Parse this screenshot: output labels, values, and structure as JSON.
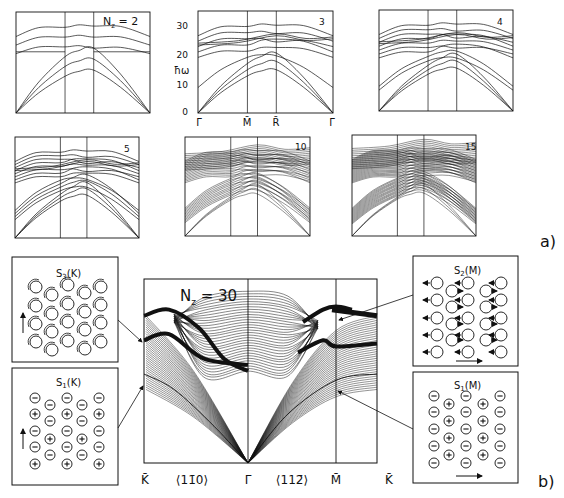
{
  "figure": {
    "part_a_label": "a)",
    "part_b_label": "b)"
  },
  "chart_data": [
    {
      "type": "line",
      "panel": "a",
      "title": "N_z = 2",
      "label": "N_z = 2",
      "x_ticks": [
        "Γ̄",
        "M̄",
        "R̄",
        "Γ̄"
      ],
      "ylabel": "ħω",
      "ylim": [
        0,
        33
      ],
      "series_count": 6,
      "series": [
        {
          "name": "branch1",
          "x": [
            0,
            1,
            2,
            3
          ],
          "values": [
            11,
            26,
            24,
            11
          ]
        },
        {
          "name": "branch2",
          "x": [
            0,
            1,
            2,
            3
          ],
          "values": [
            11,
            26,
            25,
            11
          ]
        },
        {
          "name": "branch3",
          "x": [
            0,
            1,
            2,
            3
          ],
          "values": [
            0,
            17,
            22,
            0
          ]
        },
        {
          "name": "branch4",
          "x": [
            0,
            1,
            2,
            3
          ],
          "values": [
            0,
            15,
            15,
            0
          ]
        },
        {
          "name": "branch5",
          "x": [
            0,
            1,
            2,
            3
          ],
          "values": [
            0,
            12,
            17,
            0
          ]
        },
        {
          "name": "flat",
          "x": [
            0,
            1,
            2,
            3
          ],
          "values": [
            20,
            20,
            20,
            20
          ]
        }
      ]
    },
    {
      "type": "line",
      "panel": "a",
      "label": "3",
      "x_ticks": [
        "Γ̄",
        "M̄",
        "R̄",
        "Γ̄"
      ],
      "ylabel": "ħω",
      "y_ticks": [
        0,
        10,
        20,
        30
      ],
      "ylim": [
        0,
        34
      ],
      "series": [
        {
          "name": "branch1",
          "x": [
            0,
            1,
            2,
            3
          ],
          "values": [
            14,
            28,
            26,
            14
          ]
        },
        {
          "name": "branch2",
          "x": [
            0,
            1,
            2,
            3
          ],
          "values": [
            15,
            27,
            26,
            15
          ]
        },
        {
          "name": "flat1",
          "x": [
            0,
            1,
            2,
            3
          ],
          "values": [
            25,
            25,
            26,
            25
          ]
        },
        {
          "name": "branch3",
          "x": [
            0,
            1,
            2,
            3
          ],
          "values": [
            8,
            21,
            23,
            8
          ]
        },
        {
          "name": "branch4",
          "x": [
            0,
            1,
            2,
            3
          ],
          "values": [
            0,
            17,
            23,
            0
          ]
        },
        {
          "name": "branch5",
          "x": [
            0,
            1,
            2,
            3
          ],
          "values": [
            0,
            16,
            19,
            0
          ]
        },
        {
          "name": "branch6",
          "x": [
            0,
            1,
            2,
            3
          ],
          "values": [
            0,
            13,
            15,
            0
          ]
        },
        {
          "name": "flat2",
          "x": [
            0,
            1,
            2,
            3
          ],
          "values": [
            19,
            19,
            19,
            19
          ]
        }
      ]
    },
    {
      "type": "line",
      "panel": "a",
      "label": "4",
      "x_ticks": [
        "Γ̄",
        "M̄",
        "R̄",
        "Γ̄"
      ],
      "series_count": 10
    },
    {
      "type": "line",
      "panel": "a",
      "label": "5",
      "x_ticks": [
        "Γ̄",
        "M̄",
        "R̄",
        "Γ̄"
      ],
      "series_count": 14
    },
    {
      "type": "line",
      "panel": "a",
      "label": "10",
      "x_ticks": [
        "Γ̄",
        "M̄",
        "R̄",
        "Γ̄"
      ],
      "series_count": 28
    },
    {
      "type": "line",
      "panel": "a",
      "label": "15",
      "x_ticks": [
        "Γ̄",
        "M̄",
        "R̄",
        "Γ̄"
      ],
      "series_count": 42
    },
    {
      "type": "line",
      "panel": "b",
      "label": "N_z = 30",
      "title": "N_z = 30",
      "x_ticks": [
        "K̄",
        "⟨11̄0⟩",
        "Γ̄",
        "⟨112̄⟩",
        "M̄",
        "K̄"
      ],
      "annotations": [
        "S3(K)",
        "S1(K)",
        "S2(M)",
        "S1(M)"
      ],
      "series": [
        {
          "name": "surface mode S1",
          "x": [
            "K̄",
            "Γ̄",
            "M̄",
            "K̄"
          ],
          "values": [
            13,
            0,
            13,
            14
          ]
        },
        {
          "name": "bulk band top",
          "x": [
            "K̄",
            "Γ̄",
            "M̄",
            "K̄"
          ],
          "values": [
            24,
            28,
            26,
            24
          ]
        }
      ]
    }
  ],
  "panels_a": [
    {
      "label_main": "N",
      "label_sub": "z",
      "label_rest": " = 2"
    },
    {
      "label": "3"
    },
    {
      "label": "4"
    },
    {
      "label": "5"
    },
    {
      "label": "10"
    },
    {
      "label": "15"
    }
  ],
  "axis_a": {
    "ylabel": "ħω",
    "y_ticks": [
      "0",
      "10",
      "20",
      "30"
    ],
    "x_ticks": [
      "Γ̄",
      "M̄",
      "R̄",
      "Γ̄"
    ]
  },
  "main_b": {
    "label_main": "N",
    "label_sub": "z",
    "label_rest": " = 30",
    "x_ticks": [
      "K̄",
      "⟨11̄0⟩",
      "Γ̄",
      "⟨112̄⟩",
      "M̄",
      "K̄"
    ]
  },
  "insets": {
    "s3k": {
      "title_main": "S",
      "title_sub": "3",
      "title_rest": "(K)"
    },
    "s1k": {
      "title_main": "S",
      "title_sub": "1",
      "title_rest": "(K)"
    },
    "s2m": {
      "title_main": "S",
      "title_sub": "2",
      "title_rest": "(M)"
    },
    "s1m": {
      "title_main": "S",
      "title_sub": "1",
      "title_rest": "(M)"
    }
  },
  "colors": {
    "ink": "#111111",
    "background": "#ffffff"
  }
}
